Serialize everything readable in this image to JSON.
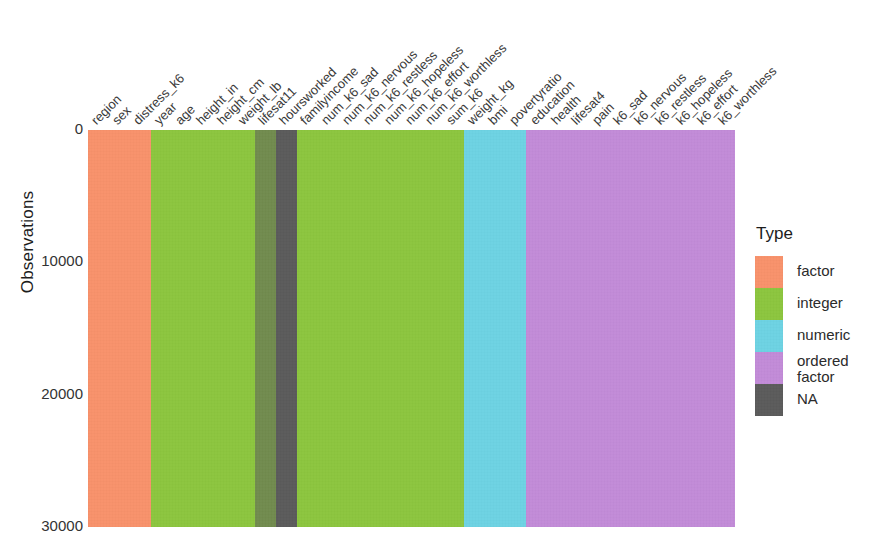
{
  "axes": {
    "y_title": "Observations",
    "y_ticks": [
      "0",
      "10000",
      "20000",
      "30000"
    ],
    "x_title": ""
  },
  "legend": {
    "title": "Type",
    "items": [
      {
        "label": "factor",
        "color": "#F8926B"
      },
      {
        "label": "integer",
        "color": "#8CC63E"
      },
      {
        "label": "numeric",
        "color": "#6DD3E3"
      },
      {
        "label": "ordered\nfactor",
        "color": "#C28BD8"
      },
      {
        "label": "NA",
        "color": "#5B5B5B"
      }
    ]
  },
  "chart_data": {
    "type": "heatmap",
    "title": "",
    "xlabel": "",
    "ylabel": "Observations",
    "ylim": [
      0,
      30000
    ],
    "y_ticks": [
      0,
      10000,
      20000,
      30000
    ],
    "y_reversed": true,
    "grid": false,
    "legend_position": "right",
    "legend_title": "Type",
    "type_colors": {
      "factor": "#F8926B",
      "integer": "#8CC63E",
      "numeric": "#6DD3E3",
      "ordered factor": "#C28BD8",
      "NA": "#5B5B5B"
    },
    "categories": [
      "region",
      "sex",
      "distress_k6",
      "year",
      "age",
      "height_in",
      "height_cm",
      "weight_lb",
      "lifesat11",
      "hoursworked",
      "familyincome",
      "num_k6_sad",
      "num_k6_nervous",
      "num_k6_restless",
      "num_k6_hopeless",
      "num_k6_effort",
      "num_k6_worthless",
      "sum_k6",
      "weight_kg",
      "bmi",
      "povertyratio",
      "education",
      "health",
      "lifesat4",
      "pain",
      "k6_sad",
      "k6_nervous",
      "k6_restless",
      "k6_hopeless",
      "k6_effort",
      "k6_worthless"
    ],
    "columns": [
      {
        "name": "region",
        "type": "factor",
        "na_fraction": 0
      },
      {
        "name": "sex",
        "type": "factor",
        "na_fraction": 0
      },
      {
        "name": "distress_k6",
        "type": "factor",
        "na_fraction": 0
      },
      {
        "name": "year",
        "type": "integer",
        "na_fraction": 0
      },
      {
        "name": "age",
        "type": "integer",
        "na_fraction": 0
      },
      {
        "name": "height_in",
        "type": "integer",
        "na_fraction": 0
      },
      {
        "name": "height_cm",
        "type": "integer",
        "na_fraction": 0
      },
      {
        "name": "weight_lb",
        "type": "integer",
        "na_fraction": 0
      },
      {
        "name": "lifesat11",
        "type": "integer",
        "na_fraction": 0.55
      },
      {
        "name": "hoursworked",
        "type": "NA",
        "na_fraction": 1
      },
      {
        "name": "familyincome",
        "type": "integer",
        "na_fraction": 0
      },
      {
        "name": "num_k6_sad",
        "type": "integer",
        "na_fraction": 0
      },
      {
        "name": "num_k6_nervous",
        "type": "integer",
        "na_fraction": 0
      },
      {
        "name": "num_k6_restless",
        "type": "integer",
        "na_fraction": 0
      },
      {
        "name": "num_k6_hopeless",
        "type": "integer",
        "na_fraction": 0
      },
      {
        "name": "num_k6_effort",
        "type": "integer",
        "na_fraction": 0
      },
      {
        "name": "num_k6_worthless",
        "type": "integer",
        "na_fraction": 0
      },
      {
        "name": "sum_k6",
        "type": "integer",
        "na_fraction": 0
      },
      {
        "name": "weight_kg",
        "type": "numeric",
        "na_fraction": 0
      },
      {
        "name": "bmi",
        "type": "numeric",
        "na_fraction": 0
      },
      {
        "name": "povertyratio",
        "type": "numeric",
        "na_fraction": 0
      },
      {
        "name": "education",
        "type": "ordered factor",
        "na_fraction": 0
      },
      {
        "name": "health",
        "type": "ordered factor",
        "na_fraction": 0
      },
      {
        "name": "lifesat4",
        "type": "ordered factor",
        "na_fraction": 0
      },
      {
        "name": "pain",
        "type": "ordered factor",
        "na_fraction": 0
      },
      {
        "name": "k6_sad",
        "type": "ordered factor",
        "na_fraction": 0
      },
      {
        "name": "k6_nervous",
        "type": "ordered factor",
        "na_fraction": 0
      },
      {
        "name": "k6_restless",
        "type": "ordered factor",
        "na_fraction": 0
      },
      {
        "name": "k6_hopeless",
        "type": "ordered factor",
        "na_fraction": 0
      },
      {
        "name": "k6_effort",
        "type": "ordered factor",
        "na_fraction": 0
      },
      {
        "name": "k6_worthless",
        "type": "ordered factor",
        "na_fraction": 0
      }
    ]
  },
  "layout": {
    "panel": {
      "left": 88,
      "top": 130,
      "width": 647,
      "height": 397
    },
    "x_label_rotation_deg": -45
  }
}
